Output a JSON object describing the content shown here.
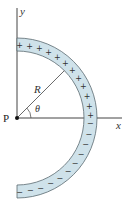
{
  "diagram": {
    "labels": {
      "y_axis": "y",
      "x_axis": "x",
      "radius": "R",
      "angle": "θ",
      "point": "P"
    },
    "center": {
      "x": 17,
      "y": 118
    },
    "arc": {
      "inner_radius": 67,
      "outer_radius": 80,
      "start_deg": 90,
      "end_deg": -90,
      "fill": "#cfe2ea",
      "stroke": "#5a6a70"
    },
    "charges": {
      "positive_symbol": "+",
      "negative_symbol": "−",
      "positive_count": 12,
      "negative_count": 11
    },
    "radius_line_angle_deg": 45,
    "colors": {
      "axis": "#444444",
      "text": "#333333"
    }
  }
}
